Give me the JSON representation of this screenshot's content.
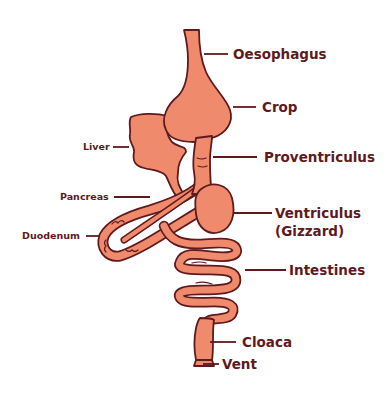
{
  "diagram": {
    "colors": {
      "organ_fill": "#F08A6C",
      "outline": "#5E1A1E",
      "label": "#5E1A1E",
      "background": "#FFFFFF"
    },
    "labels": {
      "oesophagus": "Oesophagus",
      "crop": "Crop",
      "liver": "Liver",
      "proventriculus": "Proventriculus",
      "pancreas": "Pancreas",
      "ventriculus": "Ventriculus",
      "gizzard": "(Gizzard)",
      "duodenum": "Duodenum",
      "intestines": "Intestines",
      "cloaca": "Cloaca",
      "vent": "Vent"
    }
  }
}
